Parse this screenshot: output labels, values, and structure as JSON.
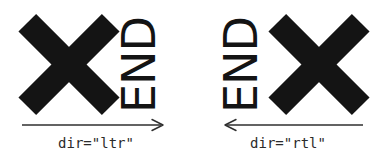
{
  "figure": {
    "background_color": "#ffffff",
    "ink_color": "#141414",
    "caption_color": "#2b2b2b",
    "panels": [
      {
        "id": "ltr",
        "direction": "ltr",
        "glyph_label": "X",
        "end_label": "END",
        "end_rotation_deg": -90,
        "arrow": {
          "name": "arrow-right",
          "points_to": "right",
          "start_x": 22,
          "end_x": 163,
          "length_px": 141
        },
        "caption": "dir=\"ltr\""
      },
      {
        "id": "rtl",
        "direction": "rtl",
        "glyph_label": "X",
        "end_label": "END",
        "end_rotation_deg": -90,
        "arrow": {
          "name": "arrow-left",
          "points_to": "left",
          "start_x": 33,
          "end_x": 170,
          "length_px": 137
        },
        "caption": "dir=\"rtl\""
      }
    ]
  }
}
